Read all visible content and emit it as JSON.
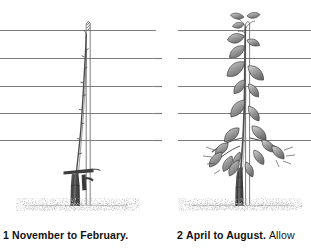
{
  "figure": {
    "type": "two-panel line illustration",
    "background_color": "#ffffff",
    "ink_color": "#3f3f3f",
    "wire_color": "#7d7d7d",
    "soil_color": "#8a8a8a"
  },
  "panels": [
    {
      "id": "panel-1",
      "step_number": "1",
      "caption_bold": "November to February.",
      "caption_regular": "",
      "scene": {
        "support_wires": 5,
        "wire_y": [
          30,
          58,
          86,
          113,
          140
        ],
        "stake_label": "vertical cane stake",
        "stake_x": 88,
        "stake_top_y": 22,
        "stake_bottom_y": 205,
        "trunk_label": "pruned trunk stump",
        "trunk_x": 74,
        "trunk_top_y": 168,
        "soil_line_y": 205,
        "cane_label": "single tied replacement cane",
        "cane_top_y": 33,
        "state": "dormant, leafless"
      }
    },
    {
      "id": "panel-2",
      "step_number": "2",
      "caption_bold": "April to August.",
      "caption_regular": "Allow",
      "scene": {
        "support_wires": 5,
        "wire_y": [
          30,
          58,
          86,
          113,
          140
        ],
        "stake_label": "vertical cane stake",
        "stake_x": 248,
        "stake_top_y": 22,
        "stake_bottom_y": 205,
        "trunk_label": "trunk with new growth",
        "trunk_x": 238,
        "trunk_top_y": 168,
        "soil_line_y": 205,
        "state": "in leaf, foliage along shoot",
        "leaf_count": 18
      }
    }
  ],
  "icons": {
    "wire": "horizontal-wire-icon",
    "soil": "soil-band-icon",
    "stake": "stake-icon",
    "trunk": "trunk-icon",
    "leaf": "leaf-icon"
  }
}
